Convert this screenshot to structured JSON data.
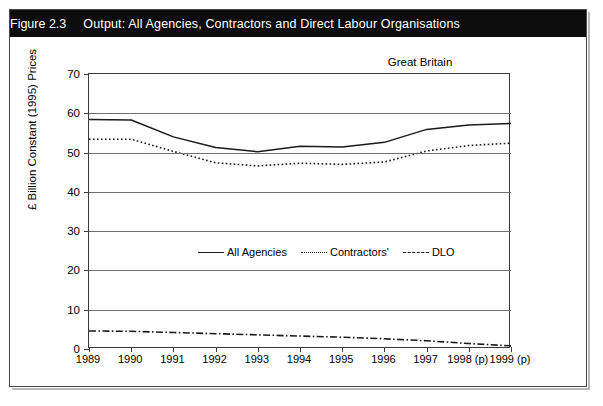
{
  "figure": {
    "number": "Figure 2.3",
    "title": "Output: All Agencies, Contractors and Direct Labour Organisations",
    "region_note": "Great Britain"
  },
  "chart_data": {
    "type": "line",
    "title": "Output: All Agencies, Contractors and Direct Labour Organisations",
    "subtitle": "Great Britain",
    "xlabel": "",
    "ylabel": "£ Billion Constant (1995) Prices",
    "categories": [
      "1989",
      "1990",
      "1991",
      "1992",
      "1993",
      "1994",
      "1995",
      "1996",
      "1997",
      "1998 (p)",
      "1999 (p)"
    ],
    "ylim": [
      0,
      70
    ],
    "yticks": [
      0,
      10,
      20,
      30,
      40,
      50,
      60,
      70
    ],
    "grid": true,
    "legend_position": "inside-center",
    "series": [
      {
        "name": "All Agencies",
        "style": "solid",
        "values": [
          58.4,
          58.3,
          54.0,
          51.3,
          50.2,
          51.6,
          51.4,
          52.6,
          55.9,
          57.0,
          57.4
        ]
      },
      {
        "name": "Contractors'",
        "style": "dotted",
        "values": [
          53.4,
          53.4,
          50.3,
          47.4,
          46.6,
          47.3,
          47.0,
          47.6,
          50.4,
          51.8,
          52.4
        ]
      },
      {
        "name": "DLO",
        "style": "dash-dot",
        "values": [
          4.6,
          4.5,
          4.2,
          3.9,
          3.6,
          3.3,
          3.0,
          2.6,
          2.1,
          1.4,
          0.8
        ]
      }
    ]
  },
  "colors": {
    "banner_background": "#0d0d0d",
    "banner_text": "#ffffff",
    "line": "#1a1a1a",
    "grid": "#6e6e6e",
    "frame": "#3a3a3a",
    "page_background": "#ffffff"
  }
}
